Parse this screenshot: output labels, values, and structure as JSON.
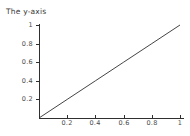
{
  "chart_data": {
    "type": "line",
    "title": "The y-axis",
    "xlabel": "",
    "ylabel": "",
    "xlim": [
      0,
      1
    ],
    "ylim": [
      0,
      1
    ],
    "grid": false,
    "legend": null,
    "axis_color": "#2f2f2f",
    "line_color": "#2f2f2f",
    "background": "#ffffff",
    "xticks": [
      {
        "value": 0.2,
        "label": "0.2"
      },
      {
        "value": 0.4,
        "label": "0.4"
      },
      {
        "value": 0.6,
        "label": "0.6"
      },
      {
        "value": 0.8,
        "label": "0.8"
      },
      {
        "value": 1.0,
        "label": "1"
      }
    ],
    "yticks": [
      {
        "value": 0.2,
        "label": "0.2"
      },
      {
        "value": 0.4,
        "label": "0.4"
      },
      {
        "value": 0.6,
        "label": "0.6"
      },
      {
        "value": 0.8,
        "label": "0.8"
      },
      {
        "value": 1.0,
        "label": "1"
      }
    ],
    "series": [
      {
        "name": "y = x",
        "x": [
          0.0,
          0.2,
          0.4,
          0.6,
          0.8,
          1.0
        ],
        "values": [
          0.0,
          0.2,
          0.4,
          0.6,
          0.8,
          1.0
        ]
      }
    ]
  }
}
